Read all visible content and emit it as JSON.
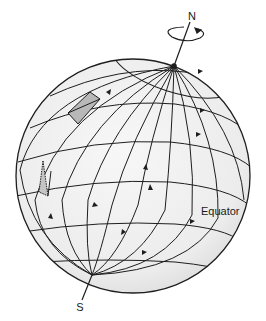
{
  "diagram": {
    "labels": {
      "north": "N",
      "south": "S",
      "equator": "Equator"
    },
    "colors": {
      "globe_fill": "#f1f1f1",
      "line": "#1e1e1e",
      "shade": "#b8b8b8",
      "background": "#ffffff"
    },
    "elements": [
      {
        "id": "globe",
        "type": "sphere"
      },
      {
        "id": "rotation-axis",
        "type": "line",
        "from": "N",
        "to": "S"
      },
      {
        "id": "rotation-arrow",
        "type": "ellipse-arrow",
        "near": "N"
      },
      {
        "id": "meridians",
        "type": "curves",
        "count": 10
      },
      {
        "id": "parallels",
        "type": "curves",
        "count": 7
      },
      {
        "id": "shaded-patch-upper",
        "type": "quadrilateral"
      },
      {
        "id": "shaded-patch-lower",
        "type": "triangle"
      }
    ]
  }
}
